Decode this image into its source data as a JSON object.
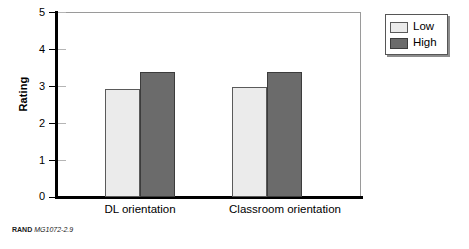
{
  "chart_data": {
    "type": "bar",
    "title": "",
    "subtitle": "",
    "xlabel": "",
    "ylabel": "Rating",
    "categories": [
      "DL orientation",
      "Classroom orientation"
    ],
    "series": [
      {
        "name": "Low",
        "values": [
          2.93,
          2.97
        ],
        "color": "#ebebeb"
      },
      {
        "name": "High",
        "values": [
          3.37,
          3.37
        ],
        "color": "#6b6b6b"
      }
    ],
    "ylim": [
      0,
      5
    ],
    "yticks": [
      0,
      1,
      2,
      3,
      4,
      5
    ],
    "ytick_labels": [
      "0",
      "1",
      "2",
      "3",
      "4",
      "5"
    ],
    "grid": false,
    "legend_position": "outside top-right",
    "legend_entries": [
      "Low",
      "High"
    ],
    "bar_grouping": "grouped-adjacent"
  },
  "axes": {
    "y_title": "Rating",
    "y_ticks": [
      "5",
      "4",
      "3",
      "2",
      "1",
      "0"
    ]
  },
  "legend": {
    "items": [
      {
        "label": "Low"
      },
      {
        "label": "High"
      }
    ]
  },
  "categories": [
    {
      "label": "DL orientation"
    },
    {
      "label": "Classroom orientation"
    }
  ],
  "caption": {
    "source": "RAND",
    "number": "MG1072-2.9"
  }
}
